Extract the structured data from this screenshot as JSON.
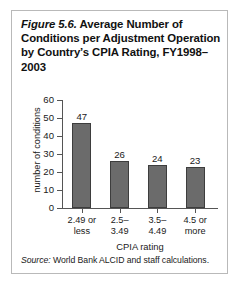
{
  "figure": {
    "number_label": "Figure 5.6.",
    "title_rest": " Average Number of Conditions per Adjustment Operation by Country’s CPIA Rating, FY1998–2003",
    "source_label": "Source:",
    "source_text": " World Bank ALCID and staff calculations.",
    "frame_color": "#b9b9b9",
    "bar_color": "#6b6b6b",
    "bar_border_color": "#3d3d3d"
  },
  "chart_data": {
    "type": "bar",
    "title": "Figure 5.6. Average Number of Conditions per Adjustment Operation by Country’s CPIA Rating, FY1998–2003",
    "categories": [
      "2.49 or less",
      "2.5–3.49",
      "3.5–4.49",
      "4.5 or more"
    ],
    "category_lines": [
      [
        "2.49 or",
        "less"
      ],
      [
        "2.5–",
        "3.49"
      ],
      [
        "3.5–",
        "4.49"
      ],
      [
        "4.5 or",
        "more"
      ]
    ],
    "values": [
      47,
      26,
      24,
      23
    ],
    "xlabel": "CPIA rating",
    "ylabel": "number of conditions",
    "ylim": [
      0,
      60
    ],
    "yticks": [
      0,
      10,
      20,
      30,
      40,
      50,
      60
    ],
    "ytick_labels": [
      "0",
      "10",
      "20",
      "30",
      "40",
      "50",
      "60"
    ],
    "grid": false,
    "legend": null,
    "data_labels": [
      "47",
      "26",
      "24",
      "23"
    ]
  }
}
